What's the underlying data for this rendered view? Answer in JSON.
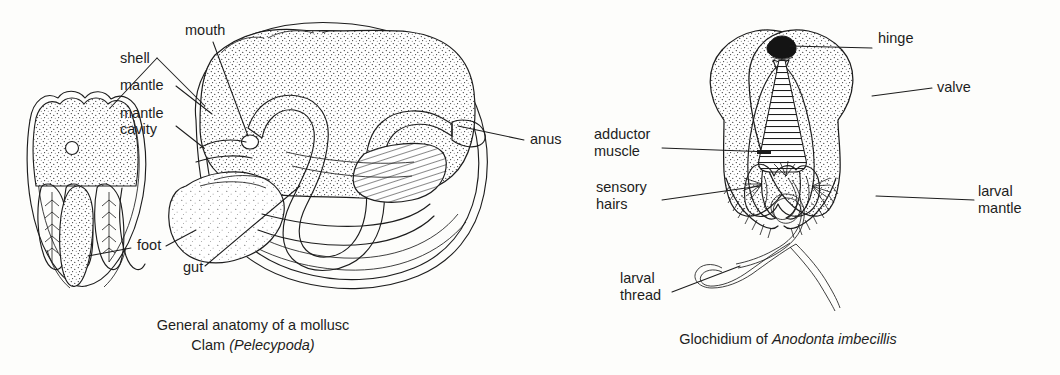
{
  "figure": {
    "background_color": "#fdfdfb",
    "ink_color": "#1d1d1d",
    "style": "black-and-white stippled line drawing, textbook biology plate"
  },
  "panels": [
    {
      "id": "clam",
      "name": "General anatomy of a mollusc",
      "caption_line1": "General anatomy of a mollusc",
      "caption_line2_plain": "Clam ",
      "caption_line2_italic": "(Pelecypoda)",
      "labels": [
        {
          "key": "mouth",
          "text": "mouth",
          "x": 185,
          "y": 35,
          "anchor": "start"
        },
        {
          "key": "shell",
          "text": "shell",
          "x": 120,
          "y": 63,
          "anchor": "start"
        },
        {
          "key": "mantle",
          "text": "mantle",
          "x": 120,
          "y": 90,
          "anchor": "start"
        },
        {
          "key": "mantle-cavity",
          "text": "mantle",
          "x": 120,
          "y": 118,
          "anchor": "start"
        },
        {
          "key": "mantle-cavity2",
          "text": "cavity",
          "x": 120,
          "y": 134,
          "anchor": "start"
        },
        {
          "key": "anus",
          "text": "anus",
          "x": 530,
          "y": 144,
          "anchor": "start"
        },
        {
          "key": "foot",
          "text": "foot",
          "x": 137,
          "y": 250,
          "anchor": "start"
        },
        {
          "key": "gut",
          "text": "gut",
          "x": 183,
          "y": 272,
          "anchor": "start"
        }
      ]
    },
    {
      "id": "glochidium",
      "name": "Glochidium of Anodonta imbecillis",
      "caption_plain": "Glochidium of ",
      "caption_italic": "Anodonta imbecillis",
      "labels": [
        {
          "key": "hinge",
          "text": "hinge",
          "x": 878,
          "y": 43,
          "anchor": "start"
        },
        {
          "key": "valve",
          "text": "valve",
          "x": 937,
          "y": 92,
          "anchor": "start"
        },
        {
          "key": "adductor",
          "text": "adductor",
          "x": 594,
          "y": 139,
          "anchor": "start"
        },
        {
          "key": "adductor2",
          "text": "muscle",
          "x": 594,
          "y": 156,
          "anchor": "start"
        },
        {
          "key": "sensory",
          "text": "sensory",
          "x": 596,
          "y": 192,
          "anchor": "start"
        },
        {
          "key": "sensory2",
          "text": "hairs",
          "x": 596,
          "y": 209,
          "anchor": "start"
        },
        {
          "key": "larval-mantle",
          "text": "larval",
          "x": 978,
          "y": 196,
          "anchor": "start"
        },
        {
          "key": "larval-mantle2",
          "text": "mantle",
          "x": 978,
          "y": 213,
          "anchor": "start"
        },
        {
          "key": "larval-thread",
          "text": "larval",
          "x": 620,
          "y": 283,
          "anchor": "start"
        },
        {
          "key": "larval-thread2",
          "text": "thread",
          "x": 620,
          "y": 300,
          "anchor": "start"
        }
      ]
    }
  ]
}
